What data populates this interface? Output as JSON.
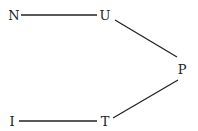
{
  "diagram": {
    "type": "graph",
    "line_color": "#222222",
    "nodes": [
      {
        "id": "N",
        "label": "N",
        "x": 14,
        "y": 15
      },
      {
        "id": "U",
        "label": "U",
        "x": 105,
        "y": 15
      },
      {
        "id": "P",
        "label": "P",
        "x": 182,
        "y": 69
      },
      {
        "id": "I",
        "label": "I",
        "x": 12,
        "y": 121
      },
      {
        "id": "T",
        "label": "T",
        "x": 105,
        "y": 121
      }
    ],
    "edges": [
      {
        "from": "N",
        "to": "U"
      },
      {
        "from": "U",
        "to": "P"
      },
      {
        "from": "P",
        "to": "T"
      },
      {
        "from": "I",
        "to": "T"
      }
    ]
  }
}
